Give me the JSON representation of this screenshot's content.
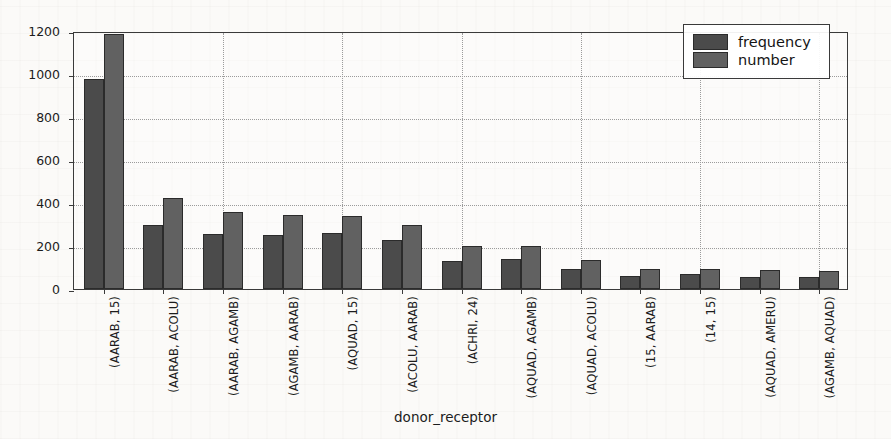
{
  "chart_data": {
    "type": "bar",
    "title": "",
    "xlabel": "donor_receptor",
    "ylabel": "",
    "ylim": [
      0,
      1200
    ],
    "yticks": [
      0,
      200,
      400,
      600,
      800,
      1000,
      1200
    ],
    "grid": true,
    "legend_position": "top-right",
    "categories": [
      "(AARAB, 15)",
      "(AARAB, ACOLU)",
      "(AARAB, AGAMB)",
      "(AGAMB, AARAB)",
      "(AQUAD, 15)",
      "(ACOLU, AARAB)",
      "(ACHRI, 24)",
      "(AQUAD, AGAMB)",
      "(AQUAD, ACOLU)",
      "(15, AARAB)",
      "(14, 15)",
      "(AQUAD, AMERU)",
      "(AGAMB, AQUAD)"
    ],
    "series": [
      {
        "name": "frequency",
        "color": "#4b4b4b",
        "values": [
          975,
          300,
          255,
          250,
          262,
          230,
          130,
          140,
          95,
          62,
          68,
          58,
          58
        ]
      },
      {
        "name": "number",
        "color": "#616161",
        "values": [
          1185,
          425,
          360,
          345,
          338,
          300,
          200,
          198,
          135,
          95,
          92,
          90,
          85
        ]
      }
    ]
  },
  "legend": {
    "items": [
      {
        "label": "frequency",
        "color": "#4b4b4b"
      },
      {
        "label": "number",
        "color": "#616161"
      }
    ]
  },
  "axes": {
    "x_title": "donor_receptor"
  }
}
